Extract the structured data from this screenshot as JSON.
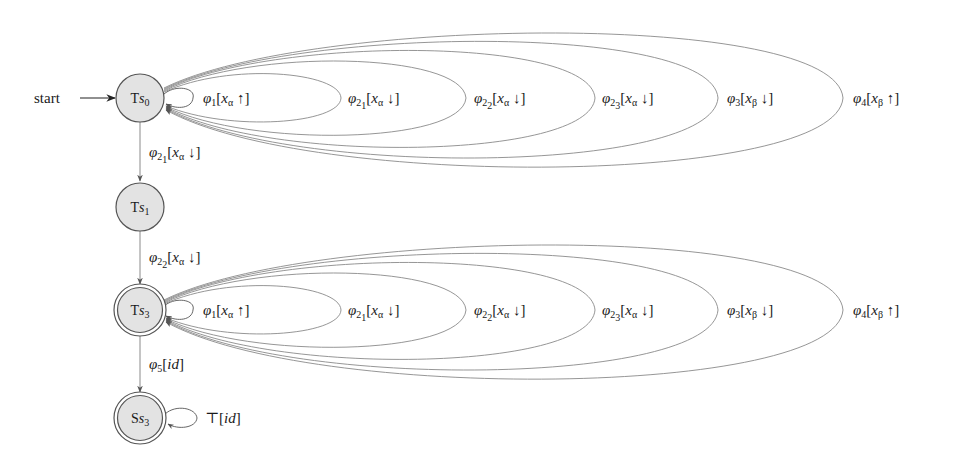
{
  "diagram": {
    "type": "state-machine",
    "start_label": "start",
    "colors": {
      "node_fill": "#e3e3e3",
      "node_stroke": "#555555",
      "edge_stroke": "#8a8a8a",
      "text": "#1a1a1a"
    },
    "nodes": [
      {
        "id": "Ts0",
        "prefix": "T",
        "var": "s",
        "sub": "0",
        "accepting": false,
        "initial": true
      },
      {
        "id": "Ts1",
        "prefix": "T",
        "var": "s",
        "sub": "1",
        "accepting": false,
        "initial": false
      },
      {
        "id": "Ts3",
        "prefix": "T",
        "var": "s",
        "sub": "3",
        "accepting": true,
        "initial": false
      },
      {
        "id": "Ss3",
        "prefix": "S",
        "var": "s",
        "sub": "3",
        "accepting": true,
        "initial": false
      }
    ],
    "edges": [
      {
        "from": "Ts0",
        "to": "Ts1",
        "phi_sub": "2",
        "phi_subsub": "1",
        "var_sub": "α",
        "dir": "↓",
        "text": "φ21[xα ↓]"
      },
      {
        "from": "Ts1",
        "to": "Ts3",
        "phi_sub": "2",
        "phi_subsub": "2",
        "var_sub": "α",
        "dir": "↓",
        "text": "φ22[xα ↓]"
      },
      {
        "from": "Ts3",
        "to": "Ss3",
        "phi_sub": "5",
        "text": "φ5[id]"
      }
    ],
    "self_loops": {
      "Ts0": [
        {
          "phi_sub": "1",
          "phi_subsub": "",
          "var_sub": "α",
          "dir": "↑",
          "text": "φ1[xα ↑]"
        },
        {
          "phi_sub": "2",
          "phi_subsub": "1",
          "var_sub": "α",
          "dir": "↓",
          "text": "φ21[xα ↓]"
        },
        {
          "phi_sub": "2",
          "phi_subsub": "2",
          "var_sub": "α",
          "dir": "↓",
          "text": "φ22[xα ↓]"
        },
        {
          "phi_sub": "2",
          "phi_subsub": "3",
          "var_sub": "α",
          "dir": "↓",
          "text": "φ23[xα ↓]"
        },
        {
          "phi_sub": "3",
          "phi_subsub": "",
          "var_sub": "β",
          "dir": "↓",
          "text": "φ3[xβ ↓]"
        },
        {
          "phi_sub": "4",
          "phi_subsub": "",
          "var_sub": "β",
          "dir": "↑",
          "text": "φ4[xβ ↑]"
        }
      ],
      "Ts3": [
        {
          "phi_sub": "1",
          "phi_subsub": "",
          "var_sub": "α",
          "dir": "↑",
          "text": "φ1[xα ↑]"
        },
        {
          "phi_sub": "2",
          "phi_subsub": "1",
          "var_sub": "α",
          "dir": "↓",
          "text": "φ21[xα ↓]"
        },
        {
          "phi_sub": "2",
          "phi_subsub": "2",
          "var_sub": "α",
          "dir": "↓",
          "text": "φ22[xα ↓]"
        },
        {
          "phi_sub": "2",
          "phi_subsub": "3",
          "var_sub": "α",
          "dir": "↓",
          "text": "φ23[xα ↓]"
        },
        {
          "phi_sub": "3",
          "phi_subsub": "",
          "var_sub": "β",
          "dir": "↓",
          "text": "φ3[xβ ↓]"
        },
        {
          "phi_sub": "4",
          "phi_subsub": "",
          "var_sub": "β",
          "dir": "↑",
          "text": "φ4[xβ ↑]"
        }
      ],
      "Ss3": [
        {
          "text": "⊤[id]",
          "symbol": "⊤",
          "arg": "id"
        }
      ]
    }
  }
}
